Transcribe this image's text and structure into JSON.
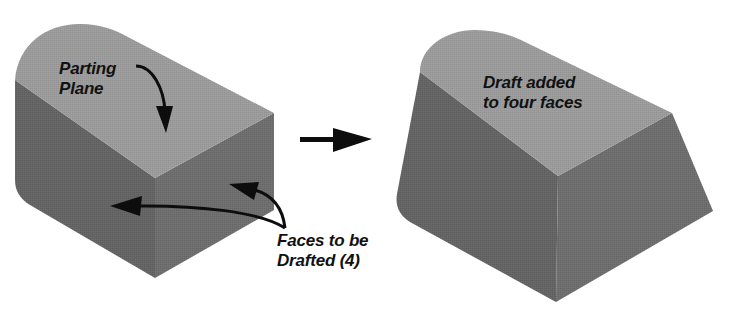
{
  "diagram": {
    "colors": {
      "top_face": "#9c9c9c",
      "left_face": "#646464",
      "right_face": "#6e6e6e",
      "arrow": "#0d0d0d",
      "text": "#111111",
      "background": "#ffffff"
    },
    "before": {
      "name": "Original part",
      "labels": {
        "parting_plane": [
          "Parting",
          "Plane"
        ],
        "faces_to_draft": [
          "Faces to be",
          "Drafted (4)"
        ]
      }
    },
    "transition_arrow": {
      "direction": "right",
      "icon": "right-arrow"
    },
    "after": {
      "name": "Drafted part",
      "labels": {
        "draft_added": [
          "Draft added",
          "to four faces"
        ]
      }
    }
  }
}
